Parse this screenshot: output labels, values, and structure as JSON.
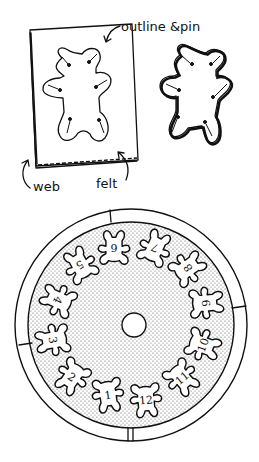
{
  "top_panel": {
    "labels": {
      "outline_pin": "outline &pin",
      "web": "web",
      "felt": "felt"
    }
  },
  "bottom_panel": {
    "bear_numbers": [
      "1",
      "2",
      "3",
      "4",
      "5",
      "6",
      "7",
      "8",
      "9",
      "10",
      "11",
      "12"
    ]
  },
  "colors": {
    "ink": "#111111",
    "paper": "#ffffff",
    "stipple": "#555555"
  }
}
